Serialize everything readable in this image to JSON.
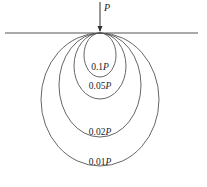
{
  "diagram": {
    "load_label": "P",
    "ground_line": {
      "x1": 5,
      "x2": 198,
      "y": 33
    },
    "apex": {
      "x": 100,
      "y": 33
    },
    "stroke_color": "#555555",
    "contours": [
      {
        "id": "c1",
        "value": "0.1",
        "unit": "P",
        "cx": 100,
        "cy": 55,
        "rx": 16,
        "ry": 22,
        "label_y": 70
      },
      {
        "id": "c2",
        "value": "0.05",
        "unit": "P",
        "cx": 100,
        "cy": 66,
        "rx": 26,
        "ry": 33,
        "label_y": 89
      },
      {
        "id": "c3",
        "value": "0.02",
        "unit": "P",
        "cx": 100,
        "cy": 85,
        "rx": 41,
        "ry": 52,
        "label_y": 135
      },
      {
        "id": "c4",
        "value": "0.01",
        "unit": "P",
        "cx": 100,
        "cy": 99.5,
        "rx": 59,
        "ry": 66.5,
        "label_y": 165
      }
    ]
  }
}
